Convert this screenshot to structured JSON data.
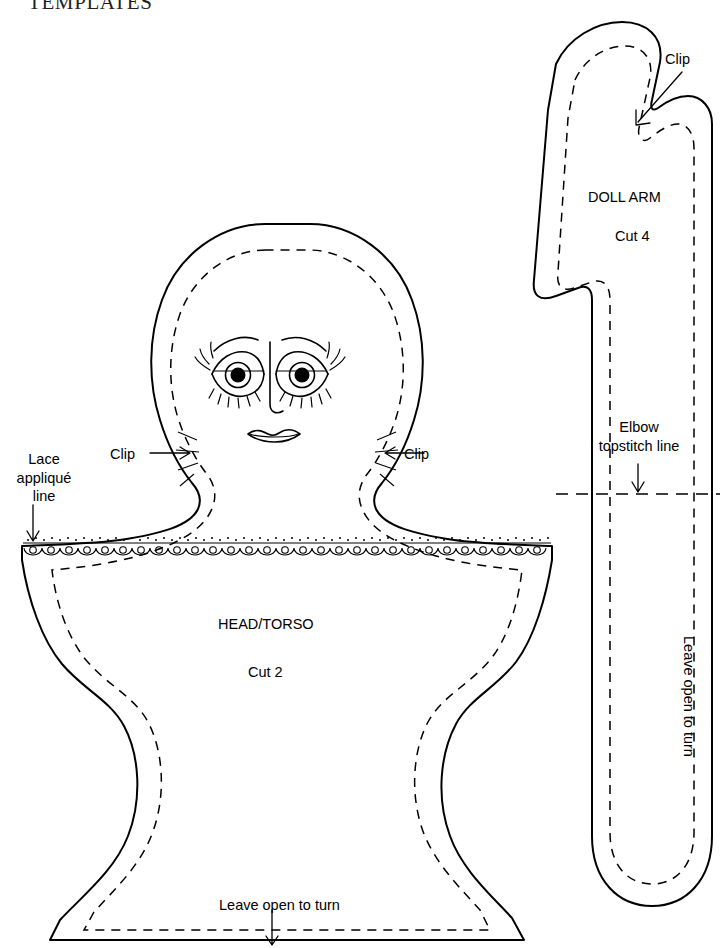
{
  "document": {
    "title": "TEMPLATES",
    "type": "sewing-pattern-templates"
  },
  "head_torso": {
    "name_label": "HEAD/TORSO",
    "cut_label": "Cut 2",
    "clip_left_label": "Clip",
    "clip_right_label": "Clip",
    "lace_label_line1": "Lace",
    "lace_label_line2": "appliqué",
    "lace_label_line3": "line",
    "bottom_label": "Leave open to turn"
  },
  "doll_arm": {
    "name_label": "DOLL ARM",
    "cut_label": "Cut 4",
    "clip_label": "Clip",
    "elbow_label_line1": "Elbow",
    "elbow_label_line2": "topstitch line",
    "side_label": "Leave open to turn"
  },
  "style": {
    "ink": "#000000",
    "paper": "#ffffff",
    "title_ink": "#231f20"
  }
}
